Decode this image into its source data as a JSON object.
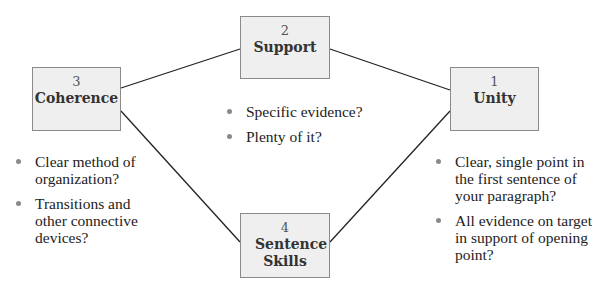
{
  "nodes": [
    {
      "id": "unity",
      "number": "1",
      "title": "Unity"
    },
    {
      "id": "support",
      "number": "2",
      "title": "Support"
    },
    {
      "id": "coherence",
      "number": "3",
      "title": "Coherence"
    },
    {
      "id": "sentence-skills",
      "number": "4",
      "title": "Sentence Skills"
    }
  ],
  "edges": [
    {
      "from": "coherence",
      "to": "support"
    },
    {
      "from": "support",
      "to": "unity"
    },
    {
      "from": "coherence",
      "to": "sentence-skills"
    },
    {
      "from": "sentence-skills",
      "to": "unity"
    }
  ],
  "bullets": {
    "support": [
      "Specific evidence?",
      "Plenty of it?"
    ],
    "coherence": [
      "Clear method of organization?",
      "Transitions and other connective devices?"
    ],
    "unity": [
      "Clear, single point in the first sentence of your paragraph?",
      "All evidence on target in support of opening point?"
    ]
  },
  "colors": {
    "box_fill": "#efefef",
    "box_border": "#8a8a8a",
    "line": "#222222",
    "bullet_dot": "#8a8a8a"
  }
}
